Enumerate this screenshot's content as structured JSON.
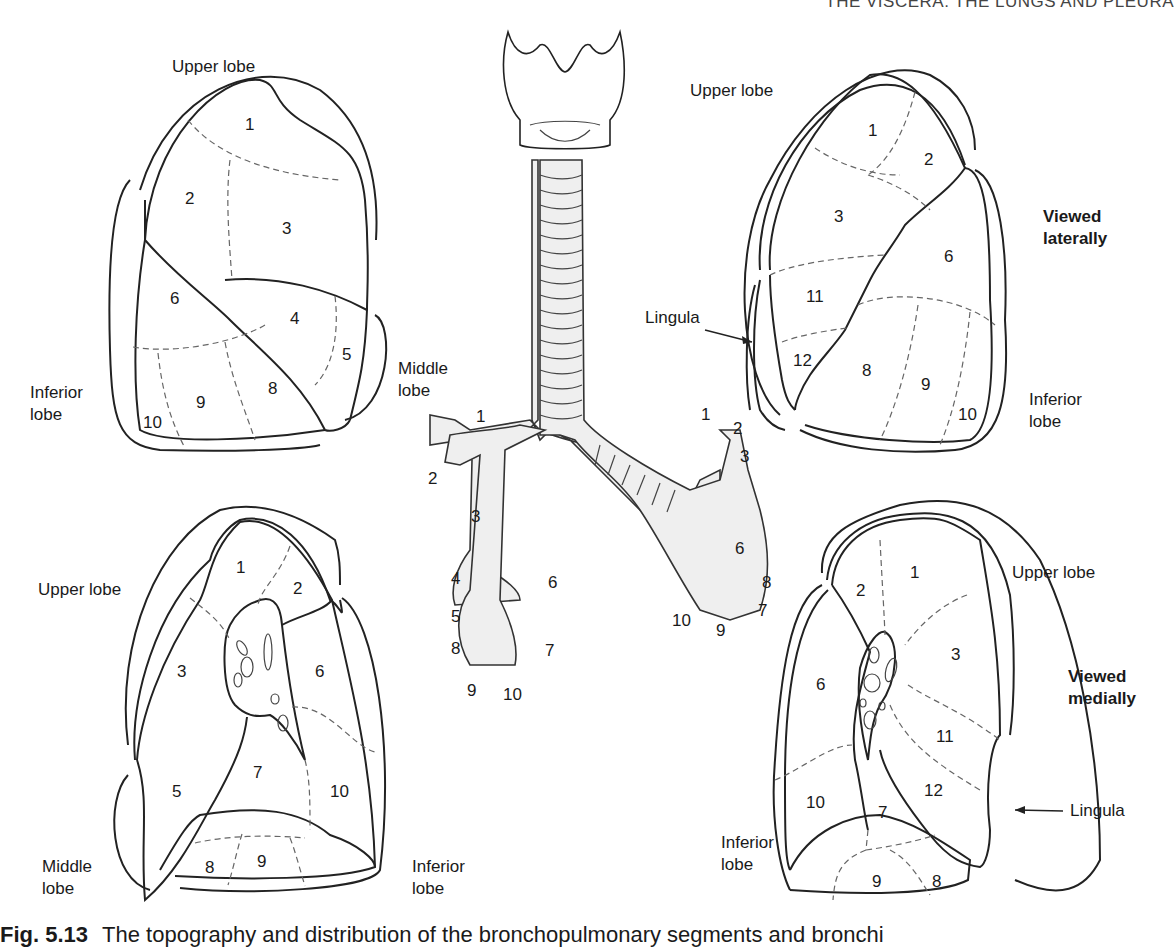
{
  "running_head": "THE VISCERA: THE LUNGS AND PLEURA",
  "caption": {
    "figure_number": "Fig. 5.13",
    "text": "The topography and distribution of the bronchopulmonary segments and bronchi"
  },
  "panels": {
    "right_lateral": {
      "labels": {
        "upper": "Upper lobe",
        "middle_l1": "Middle",
        "middle_l2": "lobe",
        "inferior_l1": "Inferior",
        "inferior_l2": "lobe"
      },
      "segments": [
        "1",
        "2",
        "3",
        "6",
        "4",
        "5",
        "8",
        "9",
        "10"
      ]
    },
    "left_lateral": {
      "labels": {
        "upper": "Upper lobe",
        "lingula": "Lingula",
        "inferior_l1": "Inferior",
        "inferior_l2": "lobe",
        "view_l1": "Viewed",
        "view_l2": "laterally"
      },
      "segments": [
        "1",
        "2",
        "3",
        "6",
        "11",
        "12",
        "8",
        "9",
        "10"
      ]
    },
    "right_medial": {
      "labels": {
        "upper": "Upper lobe",
        "middle_l1": "Middle",
        "middle_l2": "lobe",
        "inferior_l1": "Inferior",
        "inferior_l2": "lobe"
      },
      "segments": [
        "1",
        "2",
        "3",
        "6",
        "7",
        "5",
        "10",
        "8",
        "9"
      ]
    },
    "left_medial": {
      "labels": {
        "upper": "Upper lobe",
        "lingula": "Lingula",
        "inferior_l1": "Inferior",
        "inferior_l2": "lobe",
        "view_l1": "Viewed",
        "view_l2": "medially"
      },
      "segments": [
        "1",
        "2",
        "3",
        "6",
        "11",
        "12",
        "10",
        "7",
        "9",
        "8"
      ]
    },
    "bronchial_tree": {
      "right_branches": [
        "1",
        "2",
        "3",
        "4",
        "5",
        "6",
        "7",
        "8",
        "9",
        "10"
      ],
      "left_branches": [
        "1",
        "2",
        "3",
        "6",
        "8",
        "7",
        "9",
        "10"
      ]
    }
  }
}
